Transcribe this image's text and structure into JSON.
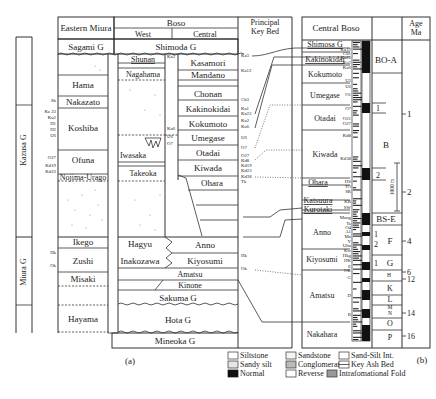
{
  "panel_a": {
    "caption": "(a)",
    "headers": {
      "eastern_miura": "Eastern Miura",
      "boso": "Boso",
      "west": "West",
      "central": "Central",
      "principal_key_bed": [
        "Principal",
        "Key Bed"
      ]
    },
    "groups": {
      "kazusa": "Kazusa G",
      "miura": "Miura G"
    },
    "top_units": {
      "sagami": "Sagami G",
      "shimoda": "Shimoda G"
    },
    "eastern_miura_units": [
      "Hama",
      "Nakazato",
      "Koshiba",
      "Ofuna",
      "Nojima-Urago",
      "Ikego",
      "Zushi",
      "Misaki",
      "Hayama"
    ],
    "eastern_miura_keybeds": [
      "Sh",
      "Ka 23",
      "Ku2",
      "H1",
      "H2",
      "U6",
      "O27",
      "Kd19",
      "Kd23",
      "Hk",
      "Ok"
    ],
    "west_units": [
      "Shunan",
      "Nagahama",
      "Iwasaka",
      "Takeoka",
      "Hagyu",
      "Inakozawa"
    ],
    "west_keybeds": [
      "Ka3",
      "Ku6",
      "U6",
      "O7"
    ],
    "central_units": [
      "Kasamori",
      "Mandano",
      "Chonan",
      "Kakinokidai",
      "Kokumoto",
      "Umegase",
      "Otadai",
      "Kiwada",
      "Ohara",
      "Anno",
      "Kiyosumi",
      "Amatsu",
      "Kinone"
    ],
    "shared_units": [
      "Sakuma G",
      "Hota G",
      "Mineoka G"
    ],
    "principal_keybeds": [
      "Ka3",
      "Ka12",
      "Ch3",
      "Ka1",
      "Ka23",
      "Ku2",
      "Ku6",
      "U6",
      "O7",
      "O27",
      "Kd8",
      "Kd19",
      "Kd23",
      "Kd38",
      "Tk",
      "Hk",
      "Ok"
    ]
  },
  "panel_b": {
    "caption": "(b)",
    "header": "Central Boso",
    "age_header": [
      "Age",
      "Ma"
    ],
    "units": [
      "Shimosa G",
      "Kakinokidai",
      "Kokumoto",
      "Umegase",
      "Otadai",
      "Kiwada",
      "Ohara",
      "Katsuura",
      "Kurotaki",
      "Anno",
      "Kiyosumi",
      "Amatsu",
      "Nakahara"
    ],
    "keybeds": [
      "Ka12",
      "Ch1",
      "Ka23",
      "Ku2",
      "Ku6",
      "U3",
      "U6",
      "O1",
      "O7",
      "O21",
      "O27",
      "Kd8",
      "Kd38",
      "HS",
      "TO",
      "SR",
      "KR",
      "SW",
      "Mang",
      "Ta",
      "O4",
      "A1",
      "Ma",
      "Y",
      "Uhu",
      "Kw",
      "Hkg",
      "HK",
      "E",
      "OK",
      "G",
      "D",
      "B"
    ],
    "polarity_zones": [
      "BO-A",
      "B",
      "BS-E",
      "F",
      "G",
      "H",
      "K",
      "L",
      "M",
      "N",
      "O",
      "P"
    ],
    "sub_zones": [
      "1",
      "2",
      "1",
      "2",
      "1"
    ],
    "scale_bar": "1000 m",
    "age_ticks": [
      "1",
      "2",
      "4",
      "6",
      "12",
      "14",
      "16"
    ]
  },
  "legend": {
    "items": [
      {
        "icon": "siltstone-swatch",
        "label": "Siltstone"
      },
      {
        "icon": "sandstone-swatch",
        "label": "Sandstone"
      },
      {
        "icon": "sand-silt-swatch",
        "label": "Sand-Silt Int."
      },
      {
        "icon": "sandy-silt-swatch",
        "label": "Sandy silt"
      },
      {
        "icon": "conglomerate-swatch",
        "label": "Conglomerate"
      },
      {
        "icon": "key-ash-swatch",
        "label": "Key Ash Bed"
      },
      {
        "icon": "normal-swatch",
        "label": "Normal"
      },
      {
        "icon": "reverse-swatch",
        "label": "Reverse"
      },
      {
        "icon": "fold-swatch",
        "label": "Intrafomational Fold"
      }
    ]
  }
}
